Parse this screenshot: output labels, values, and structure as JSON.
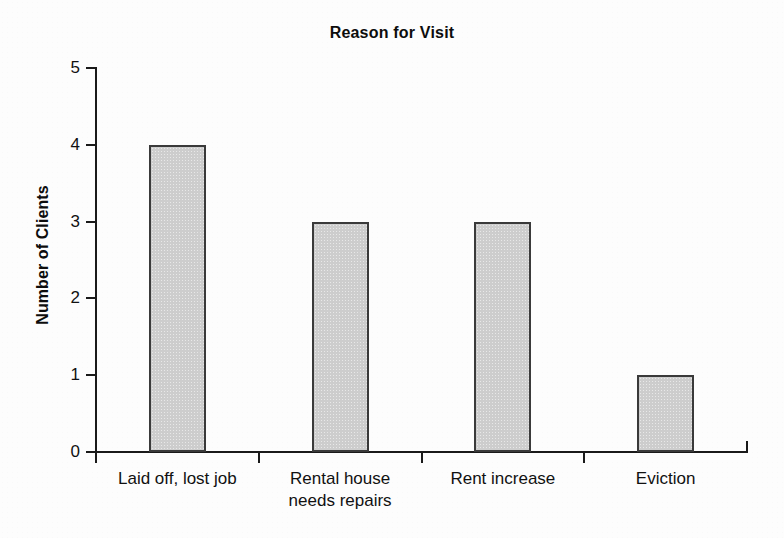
{
  "chart_data": {
    "type": "bar",
    "title": "Reason for Visit",
    "xlabel": "",
    "ylabel": "Number of Clients",
    "categories": [
      "Laid off, lost job",
      "Rental house needs repairs",
      "Rent increase",
      "Eviction"
    ],
    "category_lines": [
      [
        "Laid off, lost job"
      ],
      [
        "Rental house",
        "needs repairs"
      ],
      [
        "Rent increase"
      ],
      [
        "Eviction"
      ]
    ],
    "values": [
      4,
      3,
      3,
      1
    ],
    "ylim": [
      0,
      5
    ],
    "ytick_labels": [
      "0",
      "1",
      "2",
      "3",
      "4",
      "5"
    ],
    "ytick_values": [
      0,
      1,
      2,
      3,
      4,
      5
    ],
    "grid": false,
    "legend": false,
    "bar_fill_color": "#cdcdcd",
    "bar_border_color": "#3a3a3a",
    "axis_color": "#1a1a1a",
    "background_color": "#fdfdfd",
    "text_color": "#111111"
  }
}
